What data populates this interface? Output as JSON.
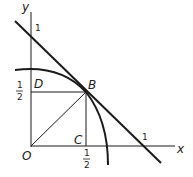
{
  "diagram": {
    "axes": {
      "x_label": "x",
      "y_label": "y"
    },
    "points": {
      "origin": "O",
      "b": "B",
      "c": "C",
      "d": "D"
    },
    "ticks": {
      "y_one": "1",
      "x_one": "1",
      "half_num": "1",
      "half_den": "2"
    },
    "colors": {
      "stroke": "#1a1a1a",
      "background": "#ffffff"
    }
  }
}
